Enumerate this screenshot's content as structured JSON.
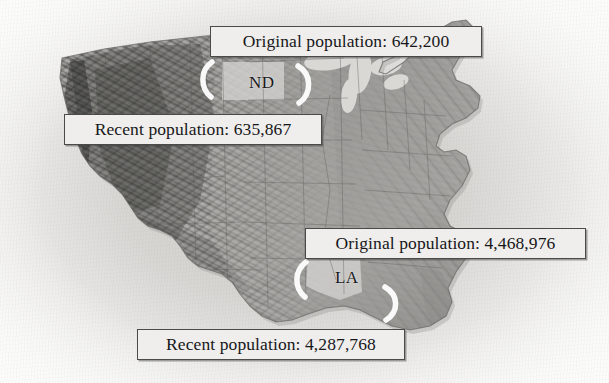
{
  "figure": {
    "type": "annotated-map",
    "region": "United States",
    "basemap_style": "grayscale shaded relief",
    "background_color": "#d7d6d3",
    "land_color": "#9a9996",
    "highlight_color": "#ffffff",
    "callout_fill": "#efeeec",
    "callout_border": "#4a4a48",
    "text_color": "#17171a"
  },
  "callouts": [
    {
      "label": "Original population: 642,200",
      "metric": "Original population",
      "value": "642,200",
      "value_number": 642200,
      "state": "ND"
    },
    {
      "label": "Recent population: 635,867",
      "metric": "Recent population",
      "value": "635,867",
      "value_number": 635867,
      "state": "ND"
    },
    {
      "label": "Original population: 4,468,976",
      "metric": "Original population",
      "value": "4,468,976",
      "value_number": 4468976,
      "state": "LA"
    },
    {
      "label": "Recent population: 4,287,768",
      "metric": "Recent population",
      "value": "4,287,768",
      "value_number": 4287768,
      "state": "LA"
    }
  ],
  "state_labels": [
    {
      "abbr": "ND",
      "name": "North Dakota"
    },
    {
      "abbr": "LA",
      "name": "Louisiana"
    }
  ],
  "pointers": [
    {
      "name": "crescent-nd-left",
      "target": "ND"
    },
    {
      "name": "crescent-nd-right",
      "target": "ND"
    },
    {
      "name": "crescent-la-left",
      "target": "LA"
    },
    {
      "name": "crescent-la-right",
      "target": "LA"
    }
  ]
}
